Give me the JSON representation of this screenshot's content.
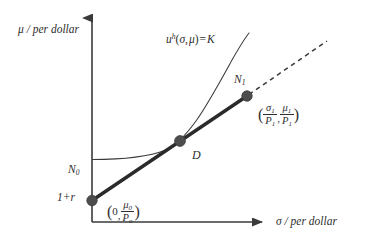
{
  "figure": {
    "kind": "economics-indifference-curve-diagram",
    "background_color": "#ffffff",
    "ink_color": "#2e2e2e",
    "marker_color": "#4d4d4d"
  },
  "axes": {
    "y_label": "μ / per dollar",
    "x_label": "σ / per dollar",
    "y_axis_x_px": 92,
    "y_axis_top_px": 15,
    "x_axis_y_px": 222,
    "x_axis_right_px": 268,
    "arrowheads": true,
    "ticks": [],
    "gridlines": false
  },
  "curve": {
    "name": "indifference-curve",
    "equation_parts": {
      "u": "u",
      "superscript": "h",
      "args_open": "(",
      "sigma": "σ",
      "comma": ",",
      "mu": "μ",
      "args_close": ")",
      "equals": "=",
      "K": "K"
    },
    "equation_plain": "uʰ(σ, μ) = K",
    "style": "thin-solid",
    "asymptote_y_px": 159
  },
  "budget_line": {
    "name": "budget-line",
    "style": "thick-solid",
    "from": "N0",
    "through": "D",
    "to": "N1"
  },
  "dashed_extension": {
    "name": "budget-line-extension",
    "style": "dashed",
    "from": "N1"
  },
  "points": [
    {
      "id": "N0",
      "label_letter": "N",
      "label_sub": "0",
      "label_plain": "N₀",
      "value_label": "1+r",
      "coord_label_plain": "(0, μ₀/Pₒ)",
      "coord_parts": {
        "open": "(",
        "x": "0",
        "comma": ",",
        "num": "μ",
        "num_sub": "0",
        "den": "P",
        "den_sub": "o",
        "close": ")"
      },
      "x_px": 92,
      "y_px": 200
    },
    {
      "id": "D",
      "label_letter": "D",
      "label_sub": "",
      "label_plain": "D",
      "value_label": "",
      "coord_label_plain": "",
      "x_px": 180,
      "y_px": 140
    },
    {
      "id": "N1",
      "label_letter": "N",
      "label_sub": "1",
      "label_plain": "N₁",
      "value_label": "",
      "coord_label_plain": "(σ₁/P₁, μ₁/P₁)",
      "coord_parts": {
        "open": "(",
        "num1": "σ",
        "num1_sub": "1",
        "den1": "P",
        "den1_sub": "1",
        "comma": ",",
        "num2": "μ",
        "num2_sub": "1",
        "den2": "P",
        "den2_sub": "1",
        "close": ")"
      },
      "x_px": 247,
      "y_px": 96
    }
  ]
}
